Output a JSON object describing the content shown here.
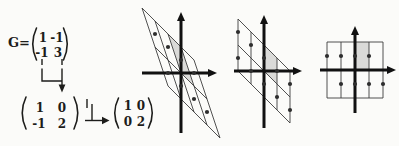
{
  "figure": {
    "colors": {
      "paper": "#fbfbf9",
      "ink": "#1d1d1b",
      "line": "#3d3d3d",
      "dot": "#2e2e2e",
      "shade": "#dadad8",
      "axis": "#111111"
    }
  },
  "matrices": {
    "g": {
      "label": "G=",
      "rows": [
        [
          "1",
          "-1"
        ],
        [
          "-1",
          "3"
        ]
      ]
    },
    "intermediate": {
      "rows": [
        [
          "1",
          "0"
        ],
        [
          "-1",
          "2"
        ]
      ]
    },
    "reduced": {
      "rows": [
        [
          "1",
          "0"
        ],
        [
          "0",
          "2"
        ]
      ]
    }
  },
  "panels": [
    {
      "name": "lattice-panel-skewed",
      "origin": [
        181,
        73
      ],
      "unit": 13,
      "basis_u": [
        1,
        -1
      ],
      "basis_v": [
        -1,
        3
      ],
      "u_range": [
        -2,
        2
      ],
      "v_range": [
        -1,
        1
      ],
      "dots_uv": [
        [
          -1.5,
          0.5
        ],
        [
          -0.5,
          0.5
        ],
        [
          0.5,
          0.5
        ],
        [
          1.5,
          0.5
        ],
        [
          -1.5,
          -0.5
        ],
        [
          -0.5,
          -0.5
        ],
        [
          0.5,
          -0.5
        ],
        [
          1.5,
          -0.5
        ]
      ],
      "cell_uv": [
        [
          0,
          0
        ],
        [
          1,
          0
        ],
        [
          1,
          1
        ],
        [
          0,
          1
        ]
      ],
      "axes": {
        "up": 61,
        "down": 60,
        "left": 39,
        "right": 36
      }
    },
    {
      "name": "lattice-panel-intermediate",
      "origin": [
        264,
        71
      ],
      "unit": 13,
      "basis_u": [
        1,
        -1
      ],
      "basis_v": [
        0,
        2
      ],
      "u_range": [
        -2,
        2
      ],
      "v_range": [
        -1,
        1
      ],
      "dots_uv": [
        [
          -2,
          0.5
        ],
        [
          -1,
          0.5
        ],
        [
          0,
          0.5
        ],
        [
          1,
          0.5
        ],
        [
          2,
          0.5
        ],
        [
          -2,
          -0.5
        ],
        [
          -1,
          -0.5
        ],
        [
          0,
          -0.5
        ],
        [
          1,
          -0.5
        ],
        [
          2,
          -0.5
        ]
      ],
      "cell_uv": [
        [
          0,
          0
        ],
        [
          1,
          0
        ],
        [
          1,
          1
        ],
        [
          0,
          1
        ]
      ],
      "axes": {
        "up": 56,
        "down": 57,
        "left": 30,
        "right": 38
      }
    },
    {
      "name": "lattice-panel-rectangular",
      "origin": [
        355,
        70
      ],
      "unit": 14,
      "basis_u": [
        1,
        0
      ],
      "basis_v": [
        0,
        2
      ],
      "u_range": [
        -2,
        2
      ],
      "v_range": [
        -1,
        1
      ],
      "dots_uv": [
        [
          -2,
          0.5
        ],
        [
          -1,
          0.5
        ],
        [
          0,
          0.5
        ],
        [
          1,
          0.5
        ],
        [
          -1,
          -0.5
        ],
        [
          0,
          -0.5
        ],
        [
          1,
          -0.5
        ],
        [
          2,
          -0.5
        ]
      ],
      "cell_uv": [
        [
          0,
          0
        ],
        [
          1,
          0
        ],
        [
          1,
          1
        ],
        [
          0,
          1
        ]
      ],
      "axes": {
        "up": 44,
        "down": 43,
        "left": 35,
        "right": 41
      }
    }
  ]
}
